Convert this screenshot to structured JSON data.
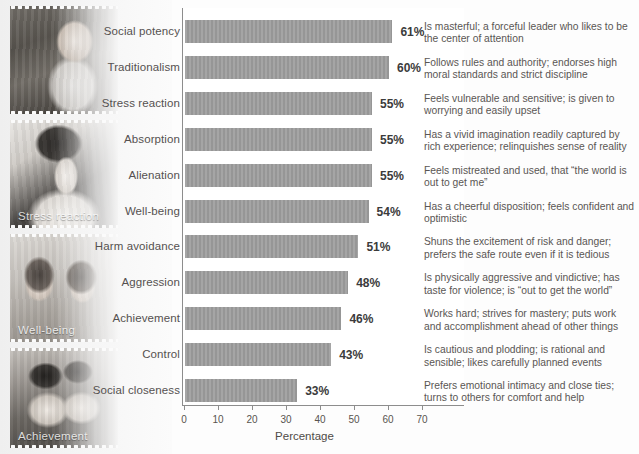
{
  "photos": [
    {
      "name": "office-worker-photo",
      "caption": ""
    },
    {
      "name": "stress-reaction-photo",
      "caption": "Stress reaction"
    },
    {
      "name": "well-being-photo",
      "caption": "Well-being"
    },
    {
      "name": "achievement-photo",
      "caption": "Achievement"
    }
  ],
  "chart_data": {
    "type": "bar",
    "orientation": "horizontal",
    "title": "",
    "xlabel": "Percentage",
    "ylabel": "",
    "xlim": [
      0,
      70
    ],
    "xticks": [
      0,
      10,
      20,
      30,
      40,
      50,
      60,
      70
    ],
    "xtick_labels": [
      "0",
      "10",
      "20",
      "30",
      "40",
      "50",
      "60",
      "70"
    ],
    "grid": false,
    "legend": "none",
    "bar_color": "#9b9b9b",
    "categories": [
      "Social potency",
      "Traditionalism",
      "Stress reaction",
      "Absorption",
      "Alienation",
      "Well-being",
      "Harm avoidance",
      "Aggression",
      "Achievement",
      "Control",
      "Social closeness"
    ],
    "values": [
      61,
      60,
      55,
      55,
      55,
      54,
      51,
      48,
      46,
      43,
      33
    ],
    "value_labels": [
      "61%",
      "60%",
      "55%",
      "55%",
      "55%",
      "54%",
      "51%",
      "48%",
      "46%",
      "43%",
      "33%"
    ],
    "descriptions": [
      "Is masterful; a forceful leader who likes to be the center of attention",
      "Follows rules and authority; endorses high moral standards and strict discipline",
      "Feels vulnerable and sensitive; is given to worrying and easily upset",
      "Has a vivid imagination readily captured by rich experience; relinquishes sense of reality",
      "Feels mistreated and used, that “the world is out to get me”",
      "Has a cheerful disposition; feels confident and optimistic",
      "Shuns the excitement of risk and danger; prefers the safe route even if it is tedious",
      "Is physically aggressive and vindictive; has taste for violence; is “out to get the world”",
      "Works hard; strives for mastery; puts work and accomplishment ahead of other things",
      "Is cautious and plodding; is rational and sensible; likes carefully planned events",
      "Prefers emotional intimacy and close ties; turns to others for comfort and help"
    ]
  }
}
